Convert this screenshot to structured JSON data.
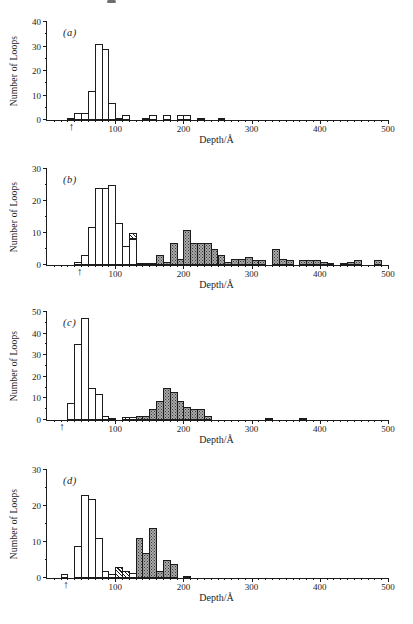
{
  "figure": {
    "ylabel": "Number of Loops",
    "xlabel": "Depth/Å",
    "x_axis": {
      "min": 0,
      "max": 500,
      "major_tick_step": 100,
      "minor_tick_step": 10,
      "tick_labels": [
        "100",
        "200",
        "300",
        "400",
        "500"
      ]
    },
    "bin_width": 10,
    "bar_style_legend": {
      "open": "open-white",
      "hatched": "diagonal-hatch",
      "shaded": "stippled-gray"
    },
    "colors": {
      "ink": "#1c1c1c",
      "paper": "#ffffff",
      "stipple_gray": "#a9a9a9"
    }
  },
  "chart_data": [
    {
      "type": "bar",
      "id": "a",
      "title": "(a)",
      "xlabel": "Depth/Å",
      "ylabel": "Number of Loops",
      "xlim": [
        0,
        500
      ],
      "ylim": [
        0,
        40
      ],
      "yticks": [
        0,
        10,
        20,
        30,
        40
      ],
      "bin_width": 10,
      "points_format": "[bin_start_angstrom, count, optional_stack_base]",
      "series": [
        {
          "name": "open",
          "style": "open-white",
          "points": [
            [
              30,
              1
            ],
            [
              40,
              3
            ],
            [
              50,
              3
            ],
            [
              60,
              12
            ],
            [
              70,
              31
            ],
            [
              80,
              29
            ],
            [
              90,
              7
            ],
            [
              100,
              1
            ],
            [
              110,
              2
            ],
            [
              140,
              1
            ],
            [
              150,
              2
            ],
            [
              170,
              2
            ],
            [
              190,
              2
            ],
            [
              200,
              2
            ],
            [
              220,
              1
            ],
            [
              250,
              1
            ]
          ]
        }
      ],
      "annotations": [
        {
          "type": "arrow-up-below-axis",
          "x": 36,
          "glyph": "↑"
        }
      ]
    },
    {
      "type": "bar",
      "id": "b",
      "title": "(b)",
      "xlabel": "Depth/Å",
      "ylabel": "Number of Loops",
      "xlim": [
        0,
        500
      ],
      "ylim": [
        0,
        30
      ],
      "yticks": [
        0,
        10,
        20,
        30
      ],
      "bin_width": 10,
      "points_format": "[bin_start_angstrom, count, optional_stack_base]",
      "series": [
        {
          "name": "open",
          "style": "open-white",
          "points": [
            [
              40,
              1
            ],
            [
              50,
              3
            ],
            [
              60,
              12
            ],
            [
              70,
              24
            ],
            [
              80,
              24
            ],
            [
              90,
              25
            ],
            [
              100,
              13
            ],
            [
              110,
              6
            ],
            [
              120,
              8
            ]
          ]
        },
        {
          "name": "hatched",
          "style": "diagonal-hatch",
          "points": [
            [
              120,
              2,
              8
            ],
            [
              130,
              0.5
            ],
            [
              140,
              0.5
            ],
            [
              150,
              0.5
            ]
          ]
        },
        {
          "name": "shaded",
          "style": "stippled-gray",
          "points": [
            [
              160,
              3
            ],
            [
              170,
              1
            ],
            [
              180,
              7
            ],
            [
              190,
              2
            ],
            [
              200,
              11
            ],
            [
              210,
              7
            ],
            [
              220,
              7
            ],
            [
              230,
              7
            ],
            [
              240,
              5
            ],
            [
              250,
              3
            ],
            [
              260,
              1
            ],
            [
              270,
              2
            ],
            [
              280,
              2
            ],
            [
              290,
              2.5
            ],
            [
              300,
              1.5
            ],
            [
              310,
              1.5
            ],
            [
              330,
              5
            ],
            [
              340,
              2
            ],
            [
              350,
              1.5
            ],
            [
              370,
              1.5
            ],
            [
              380,
              1.5
            ],
            [
              390,
              1.5
            ],
            [
              400,
              1
            ],
            [
              410,
              0.5
            ],
            [
              430,
              0.5
            ],
            [
              440,
              1
            ],
            [
              450,
              1.5
            ],
            [
              480,
              1.5
            ]
          ]
        }
      ],
      "annotations": [
        {
          "type": "arrow-up-below-axis",
          "x": 48,
          "glyph": "↑"
        }
      ]
    },
    {
      "type": "bar",
      "id": "c",
      "title": "(c)",
      "xlabel": "Depth/Å",
      "ylabel": "Number of Loops",
      "xlim": [
        0,
        500
      ],
      "ylim": [
        0,
        50
      ],
      "yticks": [
        0,
        10,
        20,
        30,
        40,
        50
      ],
      "bin_width": 10,
      "points_format": "[bin_start_angstrom, count, optional_stack_base]",
      "series": [
        {
          "name": "open",
          "style": "open-white",
          "points": [
            [
              30,
              8
            ],
            [
              40,
              35
            ],
            [
              50,
              47
            ],
            [
              60,
              15
            ],
            [
              70,
              12
            ],
            [
              80,
              2
            ],
            [
              90,
              1
            ],
            [
              120,
              1.5
            ]
          ]
        },
        {
          "name": "hatched",
          "style": "diagonal-hatch",
          "points": [
            [
              110,
              1.5
            ]
          ]
        },
        {
          "name": "shaded",
          "style": "stippled-gray",
          "points": [
            [
              130,
              2
            ],
            [
              140,
              2
            ],
            [
              150,
              5
            ],
            [
              160,
              9
            ],
            [
              170,
              15
            ],
            [
              180,
              13
            ],
            [
              190,
              9
            ],
            [
              200,
              6
            ],
            [
              210,
              5
            ],
            [
              220,
              5
            ],
            [
              230,
              2
            ],
            [
              320,
              0.5
            ],
            [
              370,
              0.5
            ]
          ]
        }
      ],
      "annotations": [
        {
          "type": "arrow-up-below-axis",
          "x": 22,
          "glyph": "↑"
        }
      ]
    },
    {
      "type": "bar",
      "id": "d",
      "title": "(d)",
      "xlabel": "Depth/Å",
      "ylabel": "Number of Loops",
      "xlim": [
        0,
        500
      ],
      "ylim": [
        0,
        30
      ],
      "yticks": [
        0,
        10,
        20,
        30
      ],
      "bin_width": 10,
      "points_format": "[bin_start_angstrom, count, optional_stack_base]",
      "series": [
        {
          "name": "open",
          "style": "open-white",
          "points": [
            [
              20,
              1
            ],
            [
              40,
              9
            ],
            [
              50,
              23
            ],
            [
              60,
              22
            ],
            [
              70,
              11
            ],
            [
              80,
              2
            ],
            [
              90,
              1
            ],
            [
              120,
              1.5
            ]
          ]
        },
        {
          "name": "hatched",
          "style": "diagonal-hatch",
          "points": [
            [
              100,
              3
            ],
            [
              110,
              2
            ]
          ]
        },
        {
          "name": "shaded",
          "style": "stippled-gray",
          "points": [
            [
              130,
              11
            ],
            [
              140,
              7
            ],
            [
              150,
              14
            ],
            [
              160,
              2
            ],
            [
              170,
              5
            ],
            [
              180,
              4
            ],
            [
              200,
              0.5
            ]
          ]
        }
      ],
      "annotations": [
        {
          "type": "arrow-up-below-axis",
          "x": 28,
          "glyph": "↑"
        }
      ]
    }
  ]
}
